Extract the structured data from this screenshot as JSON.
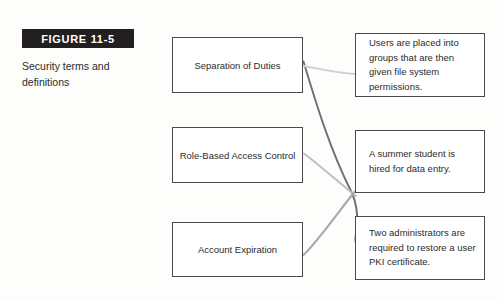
{
  "figure": {
    "label": "FIGURE 11-5",
    "caption": "Security terms and definitions",
    "label_bg_color": "#231f20",
    "label_text_color": "#ffffff"
  },
  "diagram": {
    "type": "matching-exercise",
    "terms": [
      {
        "id": "separation-of-duties",
        "label": "Separation of Duties"
      },
      {
        "id": "role-based-access",
        "label": "Role-Based Access Control"
      },
      {
        "id": "account-expiration",
        "label": "Account Expiration"
      }
    ],
    "definitions": [
      {
        "id": "def-groups",
        "label": "Users are placed into groups that are then given file system permissions."
      },
      {
        "id": "def-summer-student",
        "label": "A summer student is hired for data entry."
      },
      {
        "id": "def-two-admins",
        "label": "Two administrators are required to restore a user PKI certificate."
      }
    ],
    "connectors": [
      {
        "from": "separation-of-duties",
        "to": "def-two-admins",
        "color": "#6f6f6f"
      },
      {
        "from": "separation-of-duties",
        "to": "def-groups",
        "color": "#c6c6c6"
      },
      {
        "from": "role-based-access",
        "to": "def-summer-student",
        "color": "#b8b8b8"
      },
      {
        "from": "account-expiration",
        "to": "def-summer-student",
        "color": "#a9a9a9"
      }
    ],
    "box_border_color": "#4a4a4a",
    "box_fill_color": "#ffffff"
  }
}
